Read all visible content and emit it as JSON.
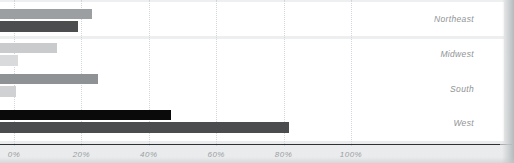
{
  "chart_data": {
    "type": "bar",
    "orientation": "horizontal",
    "title": "",
    "subtitle": "",
    "xlabel": "",
    "ylabel": "",
    "grid": true,
    "legend_position": "none",
    "xlim": [
      0,
      110
    ],
    "xticks": [
      0,
      20,
      40,
      60,
      80,
      100
    ],
    "xtick_labels": [
      "0%",
      "20%",
      "40%",
      "60%",
      "80%",
      "100%"
    ],
    "categories": [
      "Northeast",
      "Midwest",
      "South",
      "West"
    ],
    "series": [
      {
        "name": "series-1",
        "color": "#9b9fa1",
        "values": [
          23.0,
          12.8,
          24.8,
          46.6
        ]
      },
      {
        "name": "series-2",
        "color": "#4b4d4f",
        "values": [
          19.0,
          1.2,
          0.6,
          81.6
        ]
      }
    ]
  },
  "axis": {
    "ticks": [
      {
        "label": "0%",
        "value": 0
      },
      {
        "label": "20%",
        "value": 20
      },
      {
        "label": "40%",
        "value": 40
      },
      {
        "label": "60%",
        "value": 60
      },
      {
        "label": "80%",
        "value": 80
      },
      {
        "label": "100%",
        "value": 100
      }
    ]
  },
  "rows": [
    {
      "label": "Northeast"
    },
    {
      "label": "Midwest"
    },
    {
      "label": "South"
    },
    {
      "label": "West"
    }
  ],
  "colors": {
    "background": "#eef0f1",
    "band": "#ffffff",
    "gridline": "#d3d7d9",
    "axis": "#2f3234",
    "label_text": "#8f9496",
    "tick_text": "#9aa0a2",
    "series_1_northeast": "#9b9fa1",
    "series_2_northeast": "#4b4d4f",
    "series_1_midwest": "#c9cbcc",
    "series_2_midwest": "#d8dadb",
    "series_1_south": "#8f9294",
    "series_2_south": "#cfd1d2",
    "series_1_west": "#0a0a0a",
    "series_2_west": "#4a4c4e"
  }
}
